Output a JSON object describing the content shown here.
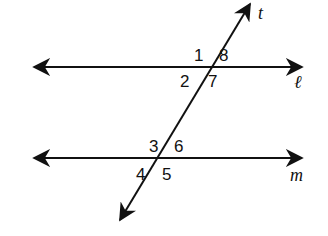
{
  "diagram": {
    "lines": {
      "l": {
        "label": "ℓ"
      },
      "m": {
        "label": "m"
      },
      "t": {
        "label": "t"
      }
    },
    "angles": {
      "a1": "1",
      "a2": "2",
      "a7": "7",
      "a8": "8",
      "a3": "3",
      "a4": "4",
      "a5": "5",
      "a6": "6"
    },
    "colors": {
      "stroke": "#111111",
      "background": "#ffffff"
    }
  }
}
